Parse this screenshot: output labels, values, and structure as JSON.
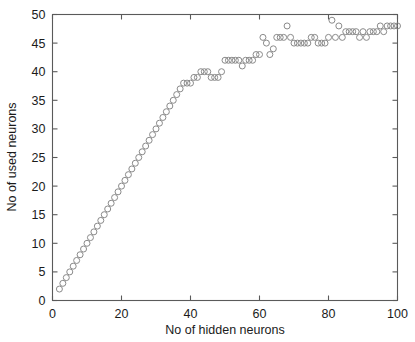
{
  "chart_data": {
    "type": "scatter",
    "title": "",
    "xlabel": "No of hidden neurons",
    "ylabel": "No of used neurons",
    "xlim": [
      0,
      100
    ],
    "ylim": [
      0,
      50
    ],
    "xticks": [
      0,
      20,
      40,
      60,
      80,
      100
    ],
    "yticks": [
      0,
      5,
      10,
      15,
      20,
      25,
      30,
      35,
      40,
      45,
      50
    ],
    "xtick_labels": [
      "0",
      "20",
      "40",
      "60",
      "80",
      "100"
    ],
    "ytick_labels": [
      "0",
      "5",
      "10",
      "15",
      "20",
      "25",
      "30",
      "35",
      "40",
      "45",
      "50"
    ],
    "grid": false,
    "legend": null,
    "marker": "open-circle",
    "marker_color": "#8a8a8a",
    "marker_size": 6,
    "series": [
      {
        "name": "used neurons vs hidden neurons",
        "x": [
          2,
          3,
          4,
          5,
          6,
          7,
          8,
          9,
          10,
          11,
          12,
          13,
          14,
          15,
          16,
          17,
          18,
          19,
          20,
          21,
          22,
          23,
          24,
          25,
          26,
          27,
          28,
          29,
          30,
          31,
          32,
          33,
          34,
          35,
          36,
          37,
          38,
          39,
          40,
          41,
          42,
          43,
          44,
          45,
          46,
          47,
          48,
          49,
          50,
          51,
          52,
          53,
          54,
          55,
          56,
          57,
          58,
          59,
          60,
          61,
          62,
          63,
          64,
          65,
          66,
          67,
          68,
          69,
          70,
          71,
          72,
          73,
          74,
          75,
          76,
          77,
          78,
          79,
          80,
          81,
          82,
          83,
          84,
          85,
          86,
          87,
          88,
          89,
          90,
          91,
          92,
          93,
          94,
          95,
          96,
          97,
          98,
          99,
          100
        ],
        "y": [
          2,
          3,
          4,
          5,
          6,
          7,
          8,
          9,
          10,
          11,
          12,
          13,
          14,
          15,
          16,
          17,
          18,
          19,
          20,
          21,
          22,
          23,
          24,
          25,
          26,
          27,
          28,
          29,
          30,
          31,
          32,
          33,
          34,
          35,
          36,
          37,
          38,
          38,
          38,
          39,
          39,
          40,
          40,
          40,
          39,
          39,
          39,
          40,
          42,
          42,
          42,
          42,
          42,
          41,
          42,
          42,
          42,
          43,
          43,
          46,
          45,
          43,
          44,
          46,
          46,
          46,
          48,
          46,
          45,
          45,
          45,
          45,
          45,
          46,
          46,
          45,
          45,
          45,
          46,
          49,
          46,
          48,
          46,
          47,
          47,
          47,
          47,
          46,
          47,
          46,
          47,
          47,
          47,
          48,
          47,
          48,
          48,
          48,
          48
        ]
      }
    ]
  },
  "axes": {
    "xlabel": "No of hidden neurons",
    "ylabel": "No of used neurons"
  }
}
